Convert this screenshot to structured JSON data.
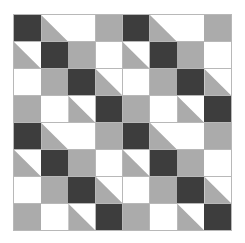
{
  "figure": {
    "rows": 8,
    "columns": 8,
    "tile_rows": 4,
    "tile_columns": 4,
    "background_color": "#ffffff",
    "gridline_color": "#b8b8b8"
  },
  "palette": {
    "dark": "#3d3d3d",
    "gray": "#ababab",
    "white": "#ffffff",
    "triangle_gray_lower_left": "#ababab"
  },
  "legend": [
    {
      "key": "dark",
      "label": "Dark charcoal square",
      "color": "#3d3d3d"
    },
    {
      "key": "gray",
      "label": "Medium gray square",
      "color": "#ababab"
    },
    {
      "key": "white",
      "label": "White square",
      "color": "#ffffff"
    },
    {
      "key": "tri-gray-ll",
      "label": "Half-square triangle, gray lower-left",
      "color": "#ababab"
    }
  ],
  "chart_data": {
    "type": "heatmap",
    "xlabel": "",
    "ylabel": "",
    "categories": [
      "1",
      "2",
      "3",
      "4",
      "5",
      "6",
      "7",
      "8"
    ],
    "grid": [
      [
        "dark",
        "tri-gray-ll",
        "white",
        "gray",
        "dark",
        "tri-gray-ll",
        "white",
        "gray"
      ],
      [
        "tri-gray-ll",
        "dark",
        "gray",
        "white",
        "tri-gray-ll",
        "dark",
        "gray",
        "white"
      ],
      [
        "white",
        "gray",
        "dark",
        "tri-gray-ll",
        "white",
        "gray",
        "dark",
        "tri-gray-ll"
      ],
      [
        "gray",
        "white",
        "tri-gray-ll",
        "dark",
        "gray",
        "white",
        "tri-gray-ll",
        "dark"
      ],
      [
        "dark",
        "tri-gray-ll",
        "white",
        "gray",
        "dark",
        "tri-gray-ll",
        "white",
        "gray"
      ],
      [
        "tri-gray-ll",
        "dark",
        "gray",
        "white",
        "tri-gray-ll",
        "dark",
        "gray",
        "white"
      ],
      [
        "white",
        "gray",
        "dark",
        "tri-gray-ll",
        "white",
        "gray",
        "dark",
        "tri-gray-ll"
      ],
      [
        "gray",
        "white",
        "tri-gray-ll",
        "dark",
        "gray",
        "white",
        "tri-gray-ll",
        "dark"
      ]
    ]
  }
}
